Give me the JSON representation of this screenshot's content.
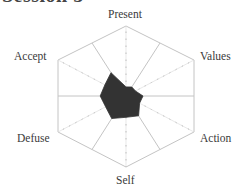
{
  "page": {
    "title": "Session 5"
  },
  "chart_data": {
    "type": "radar",
    "title": "Session 5",
    "axes": [
      "Present",
      "Values",
      "Action",
      "Self",
      "Defuse",
      "Accept"
    ],
    "spokes": [
      "Present",
      "Present-Values",
      "Values",
      "Values-Action",
      "Action",
      "Action-Self",
      "Self",
      "Self-Defuse",
      "Defuse",
      "Defuse-Accept",
      "Accept",
      "Accept-Present"
    ],
    "range": [
      0,
      10
    ],
    "ticks_per_axis": 10,
    "series": [
      {
        "name": "Session 5",
        "values": [
          1.3,
          1.7,
          1.4,
          2.5,
          2.0,
          3.7,
          3.0,
          4.2,
          3.0,
          3.8,
          3.1,
          4.4
        ],
        "fill": "#333333"
      }
    ],
    "grid": "hexagon outline with 12 spokes",
    "legend": "none"
  },
  "labels": {
    "present": "Present",
    "values": "Values",
    "action": "Action",
    "self": "Self",
    "defuse": "Defuse",
    "accept": "Accept"
  },
  "colors": {
    "grid": "#c4c4c4",
    "fill": "#333333",
    "text": "#3a3a3a"
  }
}
